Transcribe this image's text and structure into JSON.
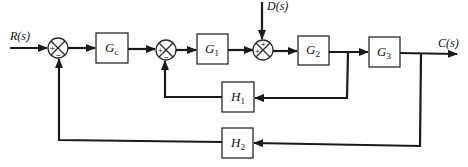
{
  "diagram": {
    "type": "block-diagram",
    "signals": {
      "input": "R(s)",
      "disturbance": "D(s)",
      "output": "C(s)"
    },
    "blocks": [
      {
        "id": "Gc",
        "main": "G",
        "sub": "c"
      },
      {
        "id": "G1",
        "main": "G",
        "sub": "1"
      },
      {
        "id": "G2",
        "main": "G",
        "sub": "2"
      },
      {
        "id": "G3",
        "main": "G",
        "sub": "3"
      },
      {
        "id": "H1",
        "main": "H",
        "sub": "1"
      },
      {
        "id": "H2",
        "main": "H",
        "sub": "2"
      }
    ],
    "summing_junctions": [
      {
        "id": "sum1",
        "signs": {
          "left": "+",
          "bottom": "−"
        }
      },
      {
        "id": "sum2",
        "signs": {
          "left": "+",
          "bottom": "−"
        }
      },
      {
        "id": "sum3",
        "signs": {
          "top": "+",
          "left": "+"
        }
      }
    ],
    "connections": [
      "R(s) -> sum1 (+)",
      "sum1 -> Gc",
      "Gc -> sum2 (+)",
      "sum2 -> G1",
      "G1 -> sum3 (+)",
      "D(s) -> sum3 (+)",
      "sum3 -> G2",
      "G2 -> G3",
      "G3 -> C(s)",
      "G2 output -> H1 -> sum2 (−)",
      "C(s) -> H2 -> sum1 (−)"
    ]
  }
}
